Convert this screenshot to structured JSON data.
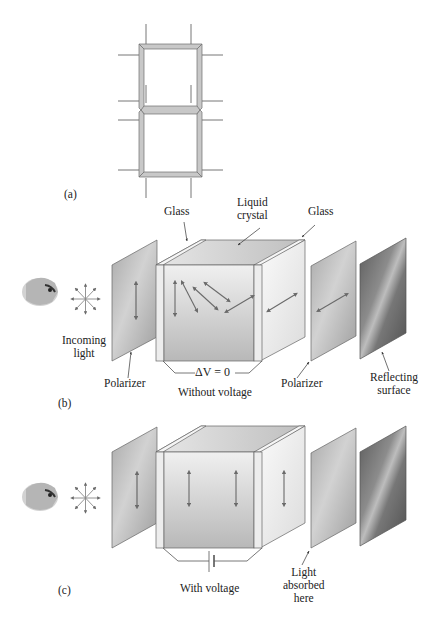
{
  "figure": {
    "panel_a": {
      "label": "(a)",
      "description": "Seven-segment display digit with segment electrodes"
    },
    "panel_b": {
      "label": "(b)",
      "labels": {
        "glass_left": "Glass",
        "liquid_crystal_line1": "Liquid",
        "liquid_crystal_line2": "crystal",
        "glass_right": "Glass",
        "incoming_light_line1": "Incoming",
        "incoming_light_line2": "light",
        "polarizer_left": "Polarizer",
        "voltage": "ΔV = 0",
        "caption": "Without voltage",
        "polarizer_right": "Polarizer",
        "reflecting_line1": "Reflecting",
        "reflecting_line2": "surface"
      }
    },
    "panel_c": {
      "label": "(c)",
      "labels": {
        "caption": "With voltage",
        "absorbed_line1": "Light",
        "absorbed_line2": "absorbed",
        "absorbed_line3": "here"
      }
    },
    "colors": {
      "segment_fill": "#c8c8c8",
      "polarizer": "#b4b4b4",
      "reflector": "#6e6e6e",
      "arrow": "#6a6a6a",
      "outline": "#555555"
    }
  }
}
